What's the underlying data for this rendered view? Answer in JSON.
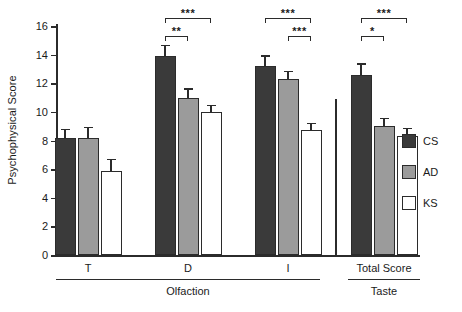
{
  "chart_data": {
    "type": "bar",
    "title": "",
    "xlabel": "",
    "ylabel": "Psychophysical Score",
    "ylim": [
      0,
      16
    ],
    "yticks": [
      0,
      2,
      4,
      6,
      8,
      10,
      12,
      14,
      16
    ],
    "grid": false,
    "legend_position": "right",
    "categories": [
      "T",
      "D",
      "I",
      "Total Score"
    ],
    "group_labels": [
      "Olfaction",
      "Taste"
    ],
    "group_spans": [
      [
        "T",
        "D",
        "I"
      ],
      [
        "Total Score"
      ]
    ],
    "series": [
      {
        "name": "CS",
        "color": "#3a3a3a",
        "values": [
          8.2,
          13.9,
          13.2,
          12.6
        ],
        "errors": [
          0.6,
          0.8,
          0.75,
          0.8
        ]
      },
      {
        "name": "AD",
        "color": "#9b9b9b",
        "values": [
          8.15,
          11.0,
          12.3,
          9.0
        ],
        "errors": [
          0.8,
          0.65,
          0.55,
          0.6
        ]
      },
      {
        "name": "KS",
        "color": "#ffffff",
        "values": [
          5.9,
          10.0,
          8.7,
          8.3
        ],
        "errors": [
          0.8,
          0.5,
          0.55,
          0.6
        ]
      }
    ],
    "annotations": [
      {
        "category": "D",
        "from": "CS",
        "to": "KS",
        "label": "***",
        "level": 2
      },
      {
        "category": "D",
        "from": "CS",
        "to": "AD",
        "label": "**",
        "level": 1
      },
      {
        "category": "I",
        "from": "CS",
        "to": "KS",
        "label": "***",
        "level": 2
      },
      {
        "category": "I",
        "from": "AD",
        "to": "KS",
        "label": "***",
        "level": 1
      },
      {
        "category": "Total Score",
        "from": "CS",
        "to": "KS",
        "label": "***",
        "level": 2
      },
      {
        "category": "Total Score",
        "from": "CS",
        "to": "AD",
        "label": "*",
        "level": 1
      }
    ]
  },
  "legend": {
    "items": [
      {
        "label": "CS"
      },
      {
        "label": "AD"
      },
      {
        "label": "KS"
      }
    ]
  }
}
